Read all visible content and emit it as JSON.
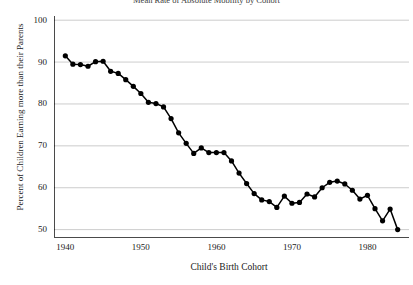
{
  "chart_data": {
    "type": "line",
    "title": "Mean Rate of Absolute Mobility by Cohort",
    "xlabel": "Child's Birth Cohort",
    "ylabel": "Percent of Children Earning more than their Parents",
    "xlim": [
      1938.5,
      1985.5
    ],
    "ylim": [
      48,
      101
    ],
    "xticks": [
      1940,
      1950,
      1960,
      1970,
      1980
    ],
    "yticks": [
      50,
      60,
      70,
      80,
      90,
      100
    ],
    "grid": "horizontal",
    "legend": "none",
    "marker": "filled-circle",
    "line_color": "#000000",
    "marker_color": "#000000",
    "grid_color": "#bfbfbf",
    "x": [
      1940,
      1941,
      1942,
      1943,
      1944,
      1945,
      1946,
      1947,
      1948,
      1949,
      1950,
      1951,
      1952,
      1953,
      1954,
      1955,
      1956,
      1957,
      1958,
      1959,
      1960,
      1961,
      1962,
      1963,
      1964,
      1965,
      1966,
      1967,
      1968,
      1969,
      1970,
      1971,
      1972,
      1973,
      1974,
      1975,
      1976,
      1977,
      1978,
      1979,
      1980,
      1981,
      1982,
      1983,
      1984
    ],
    "values": [
      91.5,
      89.5,
      89.4,
      89.0,
      90.1,
      90.2,
      87.8,
      87.3,
      85.8,
      84.2,
      82.5,
      80.4,
      80.1,
      79.3,
      76.5,
      73.1,
      70.6,
      68.2,
      69.5,
      68.4,
      68.4,
      68.4,
      66.4,
      63.5,
      61.0,
      58.6,
      57.1,
      56.7,
      55.3,
      58.0,
      56.3,
      56.5,
      58.5,
      57.8,
      60.0,
      61.3,
      61.6,
      60.9,
      59.4,
      57.3,
      58.2,
      55.0,
      52.1,
      54.9,
      50.0
    ],
    "n_points": 45,
    "note_first_point": "1940 cohort at 91.5%",
    "note_last_point": "1984 cohort at about 50%"
  }
}
